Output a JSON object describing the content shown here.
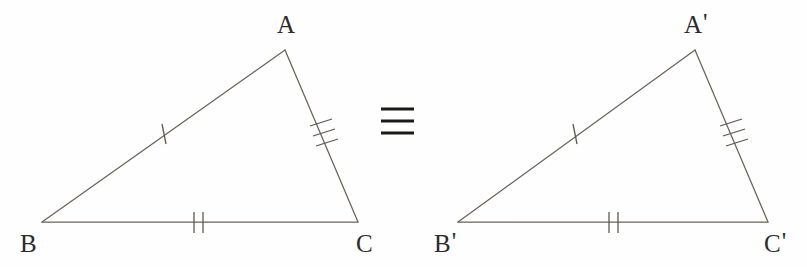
{
  "figure": {
    "background_color": "#fefefe",
    "line_color": "#6b6257",
    "tick_color": "#5f584f",
    "label_color": "#2b2b2b",
    "symbol_color": "#1c1a17"
  },
  "relation": {
    "symbol": "≡",
    "name": "congruence-symbol",
    "bar_count": 3,
    "meaning": "congruent"
  },
  "triangles": [
    {
      "id": "triangle-abc",
      "name": "left-triangle",
      "vertices": [
        {
          "label": "A",
          "prime": "",
          "x": 285,
          "y": 50,
          "label_x": 277,
          "label_y": 33
        },
        {
          "label": "B",
          "prime": "",
          "x": 42,
          "y": 222,
          "label_x": 20,
          "label_y": 252
        },
        {
          "label": "C",
          "prime": "",
          "x": 358,
          "y": 222,
          "label_x": 356,
          "label_y": 252
        }
      ],
      "sides": [
        {
          "name": "side-ab",
          "from": "A",
          "to": "B",
          "ticks": 1,
          "tick_x": 162,
          "tick_y": 134,
          "angle_deg": 35.2
        },
        {
          "name": "side-ac",
          "from": "A",
          "to": "C",
          "ticks": 3,
          "tick_x": 321,
          "tick_y": 135,
          "angle_deg": 291.3
        },
        {
          "name": "side-bc",
          "from": "B",
          "to": "C",
          "ticks": 2,
          "tick_x": 198,
          "tick_y": 222,
          "angle_deg": 0
        }
      ]
    },
    {
      "id": "triangle-a1b1c1",
      "name": "right-triangle",
      "vertices": [
        {
          "label": "A",
          "prime": "'",
          "x": 695,
          "y": 50,
          "label_x": 684,
          "label_y": 33
        },
        {
          "label": "B",
          "prime": "'",
          "x": 458,
          "y": 222,
          "label_x": 434,
          "label_y": 252
        },
        {
          "label": "C",
          "prime": "'",
          "x": 768,
          "y": 222,
          "label_x": 764,
          "label_y": 252
        }
      ],
      "sides": [
        {
          "name": "side-a1b1",
          "from": "A'",
          "to": "B'",
          "ticks": 1,
          "tick_x": 573,
          "tick_y": 134,
          "angle_deg": 35.8
        },
        {
          "name": "side-a1c1",
          "from": "A'",
          "to": "C'",
          "ticks": 3,
          "tick_x": 731,
          "tick_y": 135,
          "angle_deg": 292.6
        },
        {
          "name": "side-b1c1",
          "from": "B'",
          "to": "C'",
          "ticks": 2,
          "tick_x": 613,
          "tick_y": 222,
          "angle_deg": 0
        }
      ]
    }
  ],
  "congruence_symbol_geometry": {
    "center_x": 397,
    "bars": [
      {
        "x1": 381,
        "y1": 109,
        "x2": 414,
        "y2": 109
      },
      {
        "x1": 381,
        "y1": 121,
        "x2": 414,
        "y2": 121
      },
      {
        "x1": 381,
        "y1": 133,
        "x2": 414,
        "y2": 133
      }
    ]
  }
}
